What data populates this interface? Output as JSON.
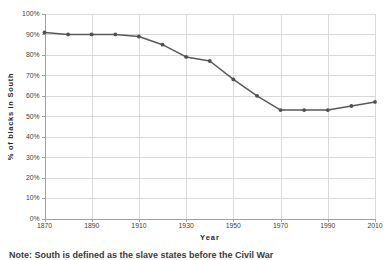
{
  "chart_data": {
    "type": "line",
    "title": "",
    "xlabel": "Year",
    "ylabel": "% of blacks in South",
    "x": [
      1870,
      1880,
      1890,
      1900,
      1910,
      1920,
      1930,
      1940,
      1950,
      1960,
      1970,
      1980,
      1990,
      2000,
      2010
    ],
    "series": [
      {
        "name": "% of blacks in South",
        "values": [
          91,
          90,
          90,
          90,
          89,
          85,
          79,
          77,
          68,
          60,
          53,
          53,
          53,
          55,
          57
        ]
      }
    ],
    "xlim": [
      1870,
      2010
    ],
    "ylim": [
      0,
      100
    ],
    "x_ticks": [
      {
        "value": 1870,
        "label": "1870"
      },
      {
        "value": 1890,
        "label": "1890"
      },
      {
        "value": 1910,
        "label": "1910"
      },
      {
        "value": 1930,
        "label": "1930"
      },
      {
        "value": 1950,
        "label": "1950"
      },
      {
        "value": 1970,
        "label": "1970"
      },
      {
        "value": 1990,
        "label": "1990"
      },
      {
        "value": 2010,
        "label": "2010"
      }
    ],
    "y_ticks": [
      {
        "value": 0,
        "label": "0%"
      },
      {
        "value": 10,
        "label": "10%"
      },
      {
        "value": 20,
        "label": "20%"
      },
      {
        "value": 30,
        "label": "30%"
      },
      {
        "value": 40,
        "label": "40%"
      },
      {
        "value": 50,
        "label": "50%"
      },
      {
        "value": 60,
        "label": "60%"
      },
      {
        "value": 70,
        "label": "70%"
      },
      {
        "value": 80,
        "label": "80%"
      },
      {
        "value": 90,
        "label": "90%"
      },
      {
        "value": 100,
        "label": "100%"
      }
    ],
    "grid": true,
    "legend": false,
    "colors": {
      "line": "#595959",
      "marker": "#4f4f4f",
      "grid": "#d9d9d9",
      "axis": "#a0a0a0",
      "tick_text": "#404040",
      "title_text": "#262626",
      "background": "#ffffff"
    }
  },
  "footnote": {
    "text": "Note: South is defined as the slave states before the Civil War"
  }
}
